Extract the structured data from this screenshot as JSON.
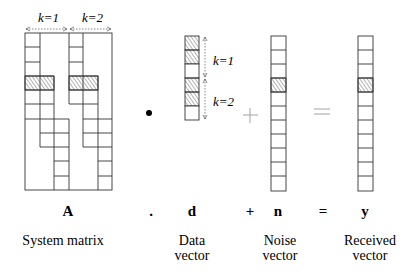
{
  "diagram": {
    "equation": {
      "system_matrix_symbol": "A",
      "dot_operator": ".",
      "data_symbol": "d",
      "plus_operator": "+",
      "noise_symbol": "n",
      "equals_operator": "=",
      "received_symbol": "y"
    },
    "captions": {
      "system_matrix": "System matrix",
      "data_vector_line1": "Data",
      "data_vector_line2": "vector",
      "noise_vector_line1": "Noise",
      "noise_vector_line2": "vector",
      "received_vector_line1": "Received",
      "received_vector_line2": "vector"
    },
    "matrix_block_labels": [
      "k=1",
      "k=2"
    ],
    "data_vector_group_labels": [
      "k=1",
      "k=2"
    ],
    "system_matrix": {
      "rows": 11,
      "columns": 6,
      "hatched_row": 3
    },
    "data_vector": {
      "cells": 6,
      "hatched_cells": [
        0,
        1,
        3,
        4
      ]
    },
    "noise_vector": {
      "cells": 11,
      "hatched_cells": [
        3
      ]
    },
    "received_vector": {
      "cells": 11,
      "hatched_cells": [
        3
      ]
    },
    "colors": {
      "line": "#333333",
      "operator_gray": "#999999",
      "hatch": "#555555"
    }
  }
}
